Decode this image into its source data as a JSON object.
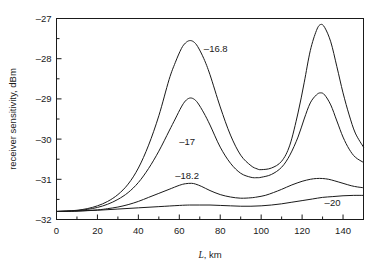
{
  "chart_data": {
    "type": "line",
    "title": "",
    "xlabel": "L, km",
    "xlabel_italic_part": "L",
    "xlabel_rest": ", km",
    "ylabel": "receiver sensitivity, dBm",
    "xlim": [
      0,
      150
    ],
    "ylim": [
      -32,
      -27
    ],
    "grid": false,
    "legend_position": "inline-annotations",
    "xticks": [
      0,
      20,
      40,
      60,
      80,
      100,
      120,
      140
    ],
    "xtick_labels": [
      "0",
      "20",
      "40",
      "60",
      "80",
      "100",
      "120",
      "140"
    ],
    "xminor_ticks": [
      10,
      30,
      50,
      70,
      90,
      110,
      130,
      150
    ],
    "yticks": [
      -27,
      -28,
      -29,
      -30,
      -31,
      -32
    ],
    "ytick_labels": [
      "–27",
      "–28",
      "–29",
      "–30",
      "–31",
      "–32"
    ],
    "yminor_ticks": [
      -27.5,
      -28.5,
      -29.5,
      -30.5,
      -31.5
    ],
    "series": [
      {
        "name": "–16.8",
        "label": "–16.8",
        "label_x": 72,
        "label_y": -27.75,
        "x": [
          0,
          5,
          10,
          15,
          20,
          25,
          30,
          35,
          40,
          45,
          50,
          55,
          58,
          61,
          63,
          65,
          67,
          69,
          72,
          75,
          80,
          85,
          90,
          95,
          98,
          100,
          105,
          110,
          114,
          118,
          121,
          124,
          127,
          129,
          131,
          134,
          137,
          140,
          143,
          146,
          150
        ],
        "y": [
          -31.8,
          -31.79,
          -31.77,
          -31.73,
          -31.66,
          -31.55,
          -31.38,
          -31.12,
          -30.72,
          -30.15,
          -29.42,
          -28.52,
          -28.1,
          -27.75,
          -27.61,
          -27.55,
          -27.58,
          -27.7,
          -28.0,
          -28.4,
          -29.2,
          -29.9,
          -30.4,
          -30.66,
          -30.74,
          -30.76,
          -30.72,
          -30.55,
          -30.15,
          -29.35,
          -28.6,
          -27.8,
          -27.3,
          -27.15,
          -27.22,
          -27.58,
          -28.2,
          -28.85,
          -29.4,
          -29.85,
          -30.2
        ]
      },
      {
        "name": "–17",
        "label": "–17",
        "label_x": 60,
        "label_y": -30.05,
        "x": [
          0,
          5,
          10,
          15,
          20,
          25,
          30,
          35,
          40,
          45,
          50,
          55,
          58,
          61,
          63,
          65,
          67,
          69,
          72,
          75,
          80,
          85,
          90,
          95,
          98,
          100,
          105,
          110,
          114,
          118,
          121,
          124,
          127,
          129,
          131,
          134,
          137,
          140,
          143,
          146,
          150
        ],
        "y": [
          -31.8,
          -31.79,
          -31.78,
          -31.75,
          -31.7,
          -31.62,
          -31.5,
          -31.33,
          -31.08,
          -30.73,
          -30.3,
          -29.8,
          -29.5,
          -29.2,
          -29.05,
          -28.98,
          -29.0,
          -29.1,
          -29.35,
          -29.65,
          -30.2,
          -30.6,
          -30.85,
          -30.95,
          -30.96,
          -30.95,
          -30.88,
          -30.7,
          -30.4,
          -29.95,
          -29.5,
          -29.1,
          -28.9,
          -28.85,
          -28.9,
          -29.15,
          -29.55,
          -29.95,
          -30.25,
          -30.45,
          -30.58
        ]
      },
      {
        "name": "–18.2",
        "label": "–18.2",
        "label_x": 58,
        "label_y": -30.9,
        "x": [
          0,
          10,
          20,
          25,
          30,
          35,
          40,
          45,
          50,
          55,
          60,
          63,
          66,
          68,
          71,
          75,
          80,
          85,
          90,
          95,
          98,
          102,
          106,
          110,
          115,
          120,
          124,
          127,
          130,
          133,
          136,
          140,
          144,
          147,
          150
        ],
        "y": [
          -31.8,
          -31.79,
          -31.76,
          -31.73,
          -31.69,
          -31.63,
          -31.55,
          -31.45,
          -31.35,
          -31.25,
          -31.15,
          -31.11,
          -31.1,
          -31.12,
          -31.18,
          -31.28,
          -31.38,
          -31.44,
          -31.47,
          -31.46,
          -31.44,
          -31.4,
          -31.33,
          -31.25,
          -31.14,
          -31.05,
          -31.0,
          -30.98,
          -30.98,
          -31.0,
          -31.04,
          -31.1,
          -31.16,
          -31.19,
          -31.21
        ]
      },
      {
        "name": "–20",
        "label": "–20",
        "label_x": 131,
        "label_y": -31.57,
        "x": [
          0,
          10,
          20,
          30,
          40,
          50,
          60,
          65,
          70,
          75,
          80,
          85,
          90,
          95,
          100,
          105,
          110,
          115,
          120,
          125,
          130,
          135,
          140,
          145,
          150
        ],
        "y": [
          -31.8,
          -31.79,
          -31.77,
          -31.74,
          -31.71,
          -31.68,
          -31.65,
          -31.64,
          -31.64,
          -31.64,
          -31.65,
          -31.66,
          -31.67,
          -31.67,
          -31.66,
          -31.64,
          -31.61,
          -31.57,
          -31.53,
          -31.49,
          -31.45,
          -31.43,
          -31.41,
          -31.4,
          -31.4
        ]
      }
    ]
  },
  "axes": {
    "y_axis_title": "receiver sensitivity, dBm",
    "x_axis_title_italic": "L",
    "x_axis_title_rest": ", km"
  }
}
